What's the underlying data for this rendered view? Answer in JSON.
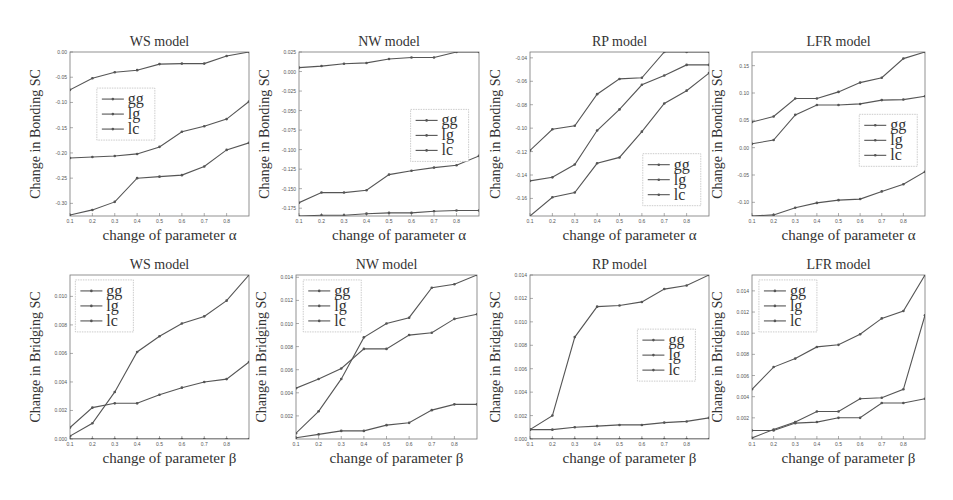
{
  "figure": {
    "row_labels": [
      "Change in Bonding SC",
      "Change in Bridging SC"
    ],
    "xlabel_alpha": "change of parameter α",
    "xlabel_beta": "change of parameter β",
    "legend": [
      "gg",
      "lg",
      "lc"
    ],
    "line_color": "#555555"
  },
  "chart_data": [
    {
      "type": "line",
      "id": "ws-bonding",
      "title": "WS model",
      "xlabel": "change of parameter α",
      "ylabel": "Change in Bonding SC",
      "x": [
        0.1,
        0.2,
        0.3,
        0.4,
        0.5,
        0.6,
        0.7,
        0.8,
        0.9
      ],
      "xticks": [
        "0.1",
        "0.2",
        "0.3",
        "0.4",
        "0.5",
        "0.6",
        "0.7",
        "0.8"
      ],
      "ylim": [
        -0.325,
        0.0
      ],
      "yticks": [
        0.0,
        -0.05,
        -0.1,
        -0.15,
        -0.2,
        -0.25,
        -0.3
      ],
      "ytick_labels": [
        "0.00",
        "-0.05",
        "-0.10",
        "-0.15",
        "-0.20",
        "-0.25",
        "-0.30"
      ],
      "legend_pos": {
        "x": 0.15,
        "y": 0.22
      },
      "series": [
        {
          "name": "gg",
          "values": [
            -0.075,
            -0.052,
            -0.04,
            -0.036,
            -0.024,
            -0.023,
            -0.023,
            -0.008,
            0.0
          ]
        },
        {
          "name": "lg",
          "values": [
            -0.21,
            -0.208,
            -0.206,
            -0.202,
            -0.188,
            -0.158,
            -0.147,
            -0.133,
            -0.098
          ]
        },
        {
          "name": "lc",
          "values": [
            -0.323,
            -0.313,
            -0.297,
            -0.25,
            -0.247,
            -0.244,
            -0.227,
            -0.194,
            -0.18
          ]
        }
      ]
    },
    {
      "type": "line",
      "id": "nw-bonding",
      "title": "NW model",
      "xlabel": "change of parameter α",
      "ylabel": "Change in Bonding SC",
      "x": [
        0.1,
        0.2,
        0.3,
        0.4,
        0.5,
        0.6,
        0.7,
        0.8,
        0.9
      ],
      "xticks": [
        "0.1",
        "0.2",
        "0.3",
        "0.4",
        "0.5",
        "0.6",
        "0.7",
        "0.8"
      ],
      "ylim": [
        -0.185,
        0.025
      ],
      "yticks": [
        0.025,
        0.0,
        -0.025,
        -0.05,
        -0.075,
        -0.1,
        -0.125,
        -0.15,
        -0.175
      ],
      "ytick_labels": [
        "0.025",
        "0.000",
        "-0.025",
        "-0.050",
        "-0.075",
        "-0.100",
        "-0.125",
        "-0.150",
        "-0.175"
      ],
      "legend_pos": {
        "x": 0.62,
        "y": 0.35
      },
      "series": [
        {
          "name": "gg",
          "values": [
            0.005,
            0.007,
            0.01,
            0.011,
            0.016,
            0.018,
            0.018,
            0.025,
            0.025
          ]
        },
        {
          "name": "lg",
          "values": [
            -0.168,
            -0.155,
            -0.155,
            -0.152,
            -0.132,
            -0.127,
            -0.123,
            -0.12,
            -0.108
          ]
        },
        {
          "name": "lc",
          "values": [
            -0.185,
            -0.184,
            -0.184,
            -0.182,
            -0.181,
            -0.181,
            -0.179,
            -0.178,
            -0.178
          ]
        }
      ]
    },
    {
      "type": "line",
      "id": "rp-bonding",
      "title": "RP model",
      "xlabel": "change of parameter α",
      "ylabel": "Change in Bonding SC",
      "x": [
        0.1,
        0.2,
        0.3,
        0.4,
        0.5,
        0.6,
        0.7,
        0.8,
        0.9
      ],
      "xticks": [
        "0.1",
        "0.2",
        "0.3",
        "0.4",
        "0.5",
        "0.6",
        "0.7",
        "0.8"
      ],
      "ylim": [
        -0.175,
        -0.035
      ],
      "yticks": [
        -0.04,
        -0.06,
        -0.08,
        -0.1,
        -0.12,
        -0.14,
        -0.16
      ],
      "ytick_labels": [
        "-0.04",
        "-0.06",
        "-0.08",
        "-0.10",
        "-0.12",
        "-0.14",
        "-0.16"
      ],
      "legend_pos": {
        "x": 0.63,
        "y": 0.62
      },
      "series": [
        {
          "name": "gg",
          "values": [
            -0.119,
            -0.101,
            -0.098,
            -0.071,
            -0.058,
            -0.057,
            -0.035,
            -0.035,
            -0.035
          ]
        },
        {
          "name": "lg",
          "values": [
            -0.145,
            -0.142,
            -0.131,
            -0.102,
            -0.084,
            -0.063,
            -0.055,
            -0.046,
            -0.046
          ]
        },
        {
          "name": "lc",
          "values": [
            -0.175,
            -0.159,
            -0.155,
            -0.13,
            -0.125,
            -0.103,
            -0.079,
            -0.068,
            -0.053
          ]
        }
      ]
    },
    {
      "type": "line",
      "id": "lfr-bonding",
      "title": "LFR model",
      "xlabel": "change of parameter α",
      "ylabel": "Change in Bonding SC",
      "x": [
        0.1,
        0.2,
        0.3,
        0.4,
        0.5,
        0.6,
        0.7,
        0.8,
        0.9
      ],
      "xticks": [
        "0.1",
        "0.2",
        "0.3",
        "0.4",
        "0.5",
        "0.6",
        "0.7",
        "0.8"
      ],
      "ylim": [
        -0.125,
        0.175
      ],
      "yticks": [
        0.15,
        0.1,
        0.05,
        0.0,
        -0.05,
        -0.1
      ],
      "ytick_labels": [
        "0.15",
        "0.10",
        "0.05",
        "0.00",
        "-0.05",
        "-0.10"
      ],
      "legend_pos": {
        "x": 0.62,
        "y": 0.38
      },
      "series": [
        {
          "name": "gg",
          "values": [
            0.047,
            0.057,
            0.09,
            0.09,
            0.102,
            0.119,
            0.128,
            0.163,
            0.175
          ]
        },
        {
          "name": "lg",
          "values": [
            0.007,
            0.014,
            0.06,
            0.078,
            0.078,
            0.08,
            0.087,
            0.088,
            0.094
          ]
        },
        {
          "name": "lc",
          "values": [
            -0.125,
            -0.123,
            -0.11,
            -0.101,
            -0.096,
            -0.094,
            -0.08,
            -0.067,
            -0.044
          ]
        }
      ]
    },
    {
      "type": "line",
      "id": "ws-bridging",
      "title": "WS model",
      "xlabel": "change of parameter β",
      "ylabel": "Change in Bridging SC",
      "x": [
        0.1,
        0.2,
        0.3,
        0.4,
        0.5,
        0.6,
        0.7,
        0.8,
        0.9
      ],
      "xticks": [
        "0.1",
        "0.2",
        "0.3",
        "0.4",
        "0.5",
        "0.6",
        "0.7",
        "0.8"
      ],
      "ylim": [
        0.0,
        0.0115
      ],
      "yticks": [
        0.0,
        0.002,
        0.004,
        0.006,
        0.008,
        0.01
      ],
      "ytick_labels": [
        "0.000",
        "0.002",
        "0.004",
        "0.006",
        "0.008",
        "0.010"
      ],
      "legend_pos": {
        "x": 0.03,
        "y": 0.03
      },
      "series": [
        {
          "name": "gg",
          "values": [
            0.0002,
            0.0011,
            0.0033,
            0.0061,
            0.0072,
            0.0081,
            0.0086,
            0.0097,
            0.0115
          ]
        },
        {
          "name": "lg",
          "values": [
            0.0008,
            0.0022,
            0.0025,
            0.0025,
            0.0031,
            0.0036,
            0.004,
            0.0042,
            0.0054
          ]
        },
        {
          "name": "lc",
          "values": [
            0.0,
            0.0,
            0.0,
            0.0,
            0.0,
            0.0,
            0.0,
            0.0,
            0.0
          ]
        }
      ]
    },
    {
      "type": "line",
      "id": "nw-bridging",
      "title": "NW model",
      "xlabel": "change of parameter β",
      "ylabel": "Change in Bridging SC",
      "x": [
        0.1,
        0.2,
        0.3,
        0.4,
        0.5,
        0.6,
        0.7,
        0.8,
        0.9
      ],
      "xticks": [
        "0.1",
        "0.2",
        "0.3",
        "0.4",
        "0.5",
        "0.6",
        "0.7",
        "0.8"
      ],
      "ylim": [
        0.0,
        0.0142
      ],
      "yticks": [
        0.014,
        0.012,
        0.01,
        0.008,
        0.006,
        0.004,
        0.002
      ],
      "ytick_labels": [
        "0.014",
        "0.012",
        "0.010",
        "0.008",
        "0.006",
        "0.004",
        "0.002"
      ],
      "legend_pos": {
        "x": 0.04,
        "y": 0.03
      },
      "series": [
        {
          "name": "gg",
          "values": [
            0.0005,
            0.0024,
            0.0052,
            0.0088,
            0.01,
            0.0105,
            0.0131,
            0.0134,
            0.0142
          ]
        },
        {
          "name": "lg",
          "values": [
            0.0044,
            0.0052,
            0.0061,
            0.0078,
            0.0078,
            0.009,
            0.0092,
            0.0104,
            0.0108
          ]
        },
        {
          "name": "lc",
          "values": [
            0.0001,
            0.0004,
            0.0007,
            0.0007,
            0.0012,
            0.0014,
            0.0025,
            0.003,
            0.003
          ]
        }
      ]
    },
    {
      "type": "line",
      "id": "rp-bridging",
      "title": "RP model",
      "xlabel": "change of parameter β",
      "ylabel": "Change in Bridging SC",
      "x": [
        0.1,
        0.2,
        0.3,
        0.4,
        0.5,
        0.6,
        0.7,
        0.8,
        0.9
      ],
      "xticks": [
        "0.1",
        "0.2",
        "0.3",
        "0.4",
        "0.5",
        "0.6",
        "0.7",
        "0.8"
      ],
      "ylim": [
        0.0,
        0.014
      ],
      "yticks": [
        0.0,
        0.002,
        0.004,
        0.006,
        0.008,
        0.01,
        0.012,
        0.014
      ],
      "ytick_labels": [
        "0.000",
        "0.002",
        "0.004",
        "0.006",
        "0.008",
        "0.010",
        "0.012",
        "0.014"
      ],
      "legend_pos": {
        "x": 0.6,
        "y": 0.33
      },
      "series": [
        {
          "name": "gg",
          "values": [
            0.0008,
            0.002,
            0.0087,
            0.0113,
            0.0114,
            0.0117,
            0.0128,
            0.0131,
            0.014
          ]
        },
        {
          "name": "lg",
          "values": [
            0.0008,
            0.0008,
            0.001,
            0.0011,
            0.0012,
            0.0012,
            0.0014,
            0.0015,
            0.0018
          ]
        },
        {
          "name": "lc",
          "values": [
            0.0,
            0.0,
            0.0,
            0.0,
            0.0,
            0.0,
            0.0,
            0.0,
            0.0
          ]
        }
      ]
    },
    {
      "type": "line",
      "id": "lfr-bridging",
      "title": "LFR model",
      "xlabel": "change of parameter β",
      "ylabel": "Change in Bridging SC",
      "x": [
        0.1,
        0.2,
        0.3,
        0.4,
        0.5,
        0.6,
        0.7,
        0.8,
        0.9
      ],
      "xticks": [
        "0.1",
        "0.2",
        "0.3",
        "0.4",
        "0.5",
        "0.6",
        "0.7",
        "0.8"
      ],
      "ylim": [
        0.0,
        0.0155
      ],
      "yticks": [
        0.014,
        0.012,
        0.01,
        0.008,
        0.006,
        0.004,
        0.002
      ],
      "ytick_labels": [
        "0.014",
        "0.012",
        "0.010",
        "0.008",
        "0.006",
        "0.004",
        "0.002"
      ],
      "legend_pos": {
        "x": 0.04,
        "y": 0.03
      },
      "series": [
        {
          "name": "gg",
          "values": [
            0.0047,
            0.0068,
            0.0076,
            0.0087,
            0.0089,
            0.0099,
            0.0114,
            0.0121,
            0.0155
          ]
        },
        {
          "name": "lg",
          "values": [
            0.0008,
            0.0008,
            0.0015,
            0.0016,
            0.002,
            0.002,
            0.0034,
            0.0034,
            0.0038
          ]
        },
        {
          "name": "lc",
          "values": [
            0.0001,
            0.0009,
            0.0016,
            0.0026,
            0.0026,
            0.0038,
            0.0039,
            0.0047,
            0.0117
          ]
        }
      ]
    }
  ],
  "layout": {
    "panels": [
      {
        "left": 0,
        "top": 0,
        "plot": {
          "x": 70,
          "y": 52,
          "w": 179,
          "h": 164
        }
      },
      {
        "left": 0,
        "top": 0,
        "plot": {
          "x": 299,
          "y": 52,
          "w": 180,
          "h": 164
        }
      },
      {
        "left": 0,
        "top": 0,
        "plot": {
          "x": 530,
          "y": 52,
          "w": 179,
          "h": 164
        }
      },
      {
        "left": 0,
        "top": 0,
        "plot": {
          "x": 752,
          "y": 52,
          "w": 173,
          "h": 164
        }
      },
      {
        "left": 0,
        "top": 0,
        "plot": {
          "x": 70,
          "y": 275,
          "w": 179,
          "h": 164
        }
      },
      {
        "left": 0,
        "top": 0,
        "plot": {
          "x": 296,
          "y": 275,
          "w": 181,
          "h": 164
        }
      },
      {
        "left": 0,
        "top": 0,
        "plot": {
          "x": 530,
          "y": 275,
          "w": 179,
          "h": 164
        }
      },
      {
        "left": 0,
        "top": 0,
        "plot": {
          "x": 752,
          "y": 275,
          "w": 173,
          "h": 164
        }
      }
    ]
  }
}
